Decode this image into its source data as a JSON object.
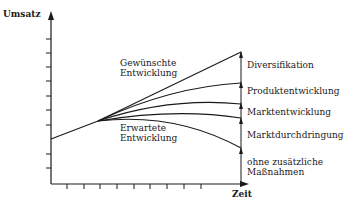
{
  "diagram": {
    "type": "strategy-gap-diagram",
    "axes": {
      "y_label": "Umsatz",
      "x_label": "Zeit"
    },
    "curve_labels": {
      "desired_line1": "Gewünschte",
      "desired_line2": "Entwicklung",
      "expected_line1": "Erwartete",
      "expected_line2": "Entwicklung"
    },
    "gap_segments": [
      {
        "label": "Diversifikation"
      },
      {
        "label": "Produktentwicklung"
      },
      {
        "label": "Marktentwicklung"
      },
      {
        "label": "Marktdurchdringung"
      },
      {
        "label_line1": "ohne zusätzliche",
        "label_line2": "Maßnahmen"
      }
    ],
    "colors": {
      "line": "#1a1a1a",
      "background": "#ffffff"
    }
  }
}
